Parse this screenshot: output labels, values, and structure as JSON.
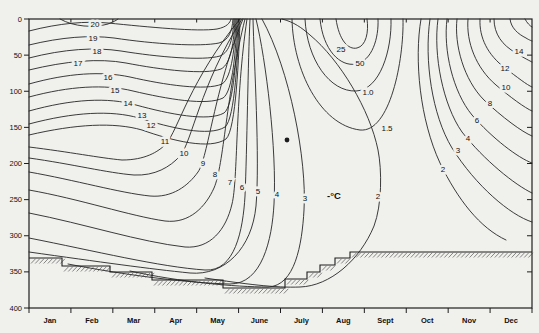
{
  "figure": {
    "width": 539,
    "height": 333,
    "background": "#f0f0ed",
    "line_color": "#262626"
  },
  "chart_data": {
    "type": "contour",
    "title": "",
    "xlabel": "",
    "ylabel": "",
    "unit_label": "°C",
    "unit_label_pos": {
      "x": 327,
      "y": 199
    },
    "x_axis": {
      "categories": [
        "Jan",
        "Feb",
        "Mar",
        "Apr",
        "May",
        "June",
        "July",
        "Aug",
        "Sept",
        "Oct",
        "Nov",
        "Dec"
      ],
      "plot_left_px": 29,
      "plot_right_px": 532
    },
    "y_axis": {
      "ticks": [
        0,
        50,
        100,
        150,
        200,
        250,
        300,
        350,
        400
      ],
      "plot_top_px": 19,
      "plot_bottom_px": 308
    },
    "contour_levels_labeled": [
      "20",
      "19",
      "18",
      "17",
      "16",
      "15",
      "14",
      "13",
      "12",
      "11",
      "10",
      "9",
      "8",
      "7",
      "6",
      "5",
      "4",
      "3",
      "2",
      "1.5",
      "1.0",
      "50",
      "25"
    ],
    "marker_dot": {
      "x": 287,
      "y": 140,
      "r": 2.4
    },
    "curves": [
      {
        "level": "21",
        "label": "",
        "lx": 0,
        "ly": 0,
        "d": "M60,19 C74,27 94,28 108,24 C112,22 116,21 118,19"
      },
      {
        "level": "20",
        "label": "20",
        "lx": 95,
        "ly": 24,
        "d": "M29,31 C60,23 86,21 108,23 C148,27 198,32 217,29 C227,27 230,23 231,19"
      },
      {
        "level": "19",
        "label": "19",
        "lx": 93,
        "ly": 38,
        "d": "M29,45 C62,37 90,35 114,38 C154,44 200,47 219,43 C229,40 232,32 233,19"
      },
      {
        "level": "18",
        "label": "18",
        "lx": 97,
        "ly": 51,
        "d": "M29,58 C64,49 95,47 121,51 C158,57 203,61 220,56 C230,52 233,38 234,19"
      },
      {
        "level": "17",
        "label": "17",
        "lx": 78,
        "ly": 63,
        "d": "M29,70 C66,61 99,58 126,63 C162,70 205,75 221,69 C231,64 234,42 235,19"
      },
      {
        "level": "16",
        "label": "16",
        "lx": 108,
        "ly": 77,
        "d": "M29,84 C68,73 102,71 130,77 C165,85 206,91 222,84 C232,78 235,45 236,19"
      },
      {
        "level": "15",
        "label": "15",
        "lx": 115,
        "ly": 90,
        "d": "M29,97 C70,86 105,84 133,91 C167,99 207,106 223,98 C233,92 236,48 237,19"
      },
      {
        "level": "14",
        "label": "14",
        "lx": 128,
        "ly": 103,
        "d": "M29,111 C72,99 108,97 136,105 C169,114 208,122 224,113 C234,106 237,51 238,19"
      },
      {
        "level": "13",
        "label": "13",
        "lx": 142,
        "ly": 115,
        "d": "M29,124 C74,112 111,110 139,118 C171,128 209,137 225,127 C235,119 238,53 239,19"
      },
      {
        "level": "12",
        "label": "12",
        "lx": 151,
        "ly": 125,
        "d": "M29,135 C76,124 114,122 142,130 C173,141 210,150 226,139 C236,130 239,55 240,19"
      },
      {
        "level": "11",
        "label": "11",
        "lx": 165,
        "ly": 141,
        "d": "M29,147 C70,152 100,158 122,160 C145,160 158,152 166,144 C178,130 190,80 240,19"
      },
      {
        "level": "10",
        "label": "10",
        "lx": 184,
        "ly": 153,
        "d": "M29,158 C72,164 108,173 134,175 C155,176 170,167 180,156 C192,142 200,85 242,19"
      },
      {
        "level": "9",
        "label": "9",
        "lx": 203,
        "ly": 163,
        "d": "M29,172 C75,180 120,193 150,196 C172,198 188,186 198,172 C208,158 214,90 243,19"
      },
      {
        "level": "8",
        "label": "8",
        "lx": 215,
        "ly": 174,
        "d": "M29,190 C80,199 130,216 165,221 C190,224 206,206 214,188 C224,165 226,95 245,19"
      },
      {
        "level": "7",
        "label": "7",
        "lx": 230,
        "ly": 182,
        "d": "M29,213 C85,224 140,242 185,247 C210,249 226,230 232,204 C238,180 235,100 247,19"
      },
      {
        "level": "6",
        "label": "6",
        "lx": 242,
        "ly": 187,
        "d": "M29,238 C95,251 160,267 205,270 C235,272 243,230 245,196 C247,150 248,60 250,19"
      },
      {
        "level": "5",
        "label": "5",
        "lx": 258,
        "ly": 191,
        "d": "M29,252 C100,262 150,269 190,273 C225,276 252,248 256,206 C260,160 254,60 253,19"
      },
      {
        "level": "4",
        "label": "4",
        "lx": 277,
        "ly": 194,
        "d": "M68,264 C130,276 190,283 230,284 C262,284 272,240 274,204 C277,150 266,60 256,19"
      },
      {
        "level": "3",
        "label": "3",
        "lx": 305,
        "ly": 198,
        "d": "M130,271 C180,282 235,287 268,287 C295,286 302,245 304,210 C307,160 290,70 262,19"
      },
      {
        "level": "2",
        "label": "2",
        "lx": 378,
        "ly": 196,
        "d": "M205,278 C245,284 275,288 300,287 C330,286 360,260 374,226 C382,205 382,170 378,150 C370,110 340,60 310,35 C302,28 294,22 282,19"
      },
      {
        "level": "1.5",
        "label": "1.5",
        "lx": 387,
        "ly": 128,
        "d": "M292,19 C293,70 320,125 360,130 C390,133 404,60 403,19"
      },
      {
        "level": "1.0",
        "label": "1.0",
        "lx": 368,
        "ly": 92,
        "d": "M305,19 C307,60 330,92 356,91 C380,90 392,50 391,19"
      },
      {
        "level": "50",
        "label": "50",
        "lx": 360,
        "ly": 63,
        "d": "M320,19 C323,50 340,67 356,64 C372,61 379,38 378,19"
      },
      {
        "level": "25",
        "label": "25",
        "lx": 341,
        "ly": 49,
        "d": "M336,19 C339,40 348,50 357,48 C366,46 369,32 367,19"
      },
      {
        "level": "2r",
        "label": "2",
        "lx": 443,
        "ly": 169,
        "d": "M421,19 C414,60 420,120 440,163 C458,200 480,228 506,240"
      },
      {
        "level": "3r",
        "label": "3",
        "lx": 458,
        "ly": 150,
        "d": "M430,19 C424,60 432,115 452,148 C476,186 510,215 532,222"
      },
      {
        "level": "4r",
        "label": "4",
        "lx": 468,
        "ly": 138,
        "d": "M438,19 C433,55 443,105 462,132 C484,160 515,185 532,193"
      },
      {
        "level": "6r",
        "label": "6",
        "lx": 477,
        "ly": 120,
        "d": "M447,19 C443,50 453,92 472,115 C492,138 518,158 532,163"
      },
      {
        "level": "8r",
        "label": "8",
        "lx": 490,
        "ly": 103,
        "d": "M457,19 C454,45 464,80 484,100 C502,117 522,132 532,136"
      },
      {
        "level": "10r",
        "label": "10",
        "lx": 506,
        "ly": 87,
        "d": "M468,19 C466,42 476,68 496,85 C510,97 525,108 532,111"
      },
      {
        "level": "12r",
        "label": "12",
        "lx": 505,
        "ly": 68,
        "d": "M480,19 C479,38 488,55 505,68 C517,77 527,85 532,87"
      },
      {
        "level": "14r",
        "label": "14",
        "lx": 519,
        "ly": 51,
        "d": "M494,19 C494,34 502,45 516,53 C524,58 530,61 532,62"
      },
      {
        "level": "16r",
        "label": "",
        "lx": 0,
        "ly": 0,
        "d": "M510,19 C511,28 518,34 526,38 C529,40 532,41 532,41"
      },
      {
        "level": "18r",
        "label": "",
        "lx": 0,
        "ly": 0,
        "d": "M525,19 C527,23 530,26 532,27"
      }
    ],
    "floor_profile_px": [
      {
        "x1": 29,
        "x2": 62,
        "y": 258
      },
      {
        "x1": 62,
        "x2": 110,
        "y": 266
      },
      {
        "x1": 110,
        "x2": 152,
        "y": 272
      },
      {
        "x1": 152,
        "x2": 223,
        "y": 280
      },
      {
        "x1": 223,
        "x2": 285,
        "y": 288
      },
      {
        "x1": 285,
        "x2": 307,
        "y": 279
      },
      {
        "x1": 307,
        "x2": 320,
        "y": 272
      },
      {
        "x1": 320,
        "x2": 335,
        "y": 265
      },
      {
        "x1": 335,
        "x2": 350,
        "y": 258
      },
      {
        "x1": 350,
        "x2": 532,
        "y": 252
      }
    ]
  }
}
